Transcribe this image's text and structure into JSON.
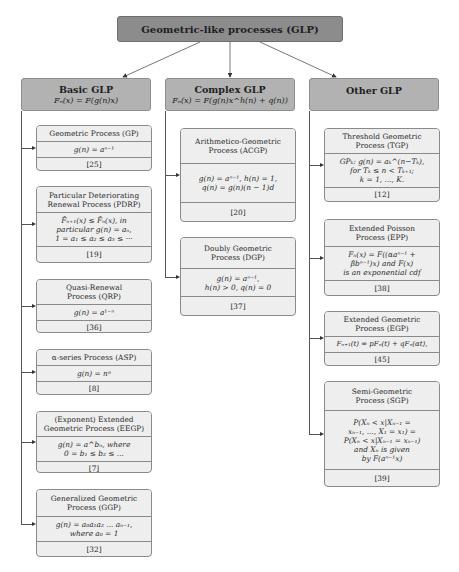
{
  "root": {
    "title": "Geometric-like processes (GLP)"
  },
  "categories": [
    {
      "title": "Basic GLP",
      "formula": "Fₙ(x) = F(g(n)x)",
      "items": [
        {
          "name": "Geometric Process (GP)",
          "definition": "g(n) = aⁿ⁻¹",
          "ref": "[25]"
        },
        {
          "name": "Particular Deteriorating\nRenewal Process (PDRP)",
          "definition": "F̄ₙ₊₁(x) ≤ F̄ₙ(x), in\nparticular g(n) = aₙ,\n1 = a₁ ≤ a₂ ≤ a₃ ≤ ···",
          "ref": "[19]"
        },
        {
          "name": "Quasi-Renewal\nProcess (QRP)",
          "definition": "g(n) = a¹⁻ⁿ",
          "ref": "[36]"
        },
        {
          "name": "α-series Process (ASP)",
          "definition": "g(n) = nᵅ",
          "ref": "[8]"
        },
        {
          "name": "(Exponent) Extended\nGeometric Process (EEGP)",
          "definition": "g(n) = a^bₙ, where\n0 = b₁ ≤ b₂ ≤ ...",
          "ref": "[7]"
        },
        {
          "name": "Generalized Geometric\nProcess (GGP)",
          "definition": "g(n) = a₀a₁a₂ ... aₙ₋₁,\nwhere a₀ = 1",
          "ref": "[32]"
        }
      ]
    },
    {
      "title": "Complex GLP",
      "formula": "Fₙ(x) = F(g(n)x^h(n) + q(n))",
      "items": [
        {
          "name": "Arithmetico-Geometric\nProcess (ACGP)",
          "definition": "g(n) = aⁿ⁻¹, h(n) = 1,\nq(n) = g(n)(n − 1)d",
          "ref": "[20]"
        },
        {
          "name": "Doubly Geometric\nProcess (DGP)",
          "definition": "g(n) = aⁿ⁻¹,\nh(n) > 0, q(n) = 0",
          "ref": "[37]"
        }
      ]
    },
    {
      "title": "Other GLP",
      "formula": "",
      "items": [
        {
          "name": "Threshold Geometric\nProcess (TGP)",
          "definition": "GPₖ: g(n) = aₖ^(n−Tₖ),\nfor Tₖ ≤ n < Tₖ₊₁;\nk = 1, ..., K.",
          "ref": "[12]"
        },
        {
          "name": "Extended Poisson\nProcess (EPP)",
          "definition": "Fₙ(x) = F((αaⁿ⁻¹ +\nβbⁿ⁻¹)x) and F(x)\nis an exponential cdf",
          "ref": "[38]"
        },
        {
          "name": "Extended Geometric\nProcess (EGP)",
          "definition": "Fₙ₊₁(t) = pFₙ(t) + qFₙ(αt),",
          "ref": "[45]"
        },
        {
          "name": "Semi-Geometric\nProcess (SGP)",
          "definition": "P(Xₙ < x|Xₙ₋₁ =\nxₙ₋₁, ..., X₁ = x₁) =\nP(Xₙ < x|Xₙ₋₁ = xₙ₋₁)\nand Xₙ is given\nby F(aⁿ⁻¹x)",
          "ref": "[39]"
        }
      ]
    }
  ],
  "colors": {
    "root_fill": "#8c8c8c",
    "category_fill": "#b2b2b2",
    "card_fill": "#eeeeee",
    "line": "#555555"
  }
}
